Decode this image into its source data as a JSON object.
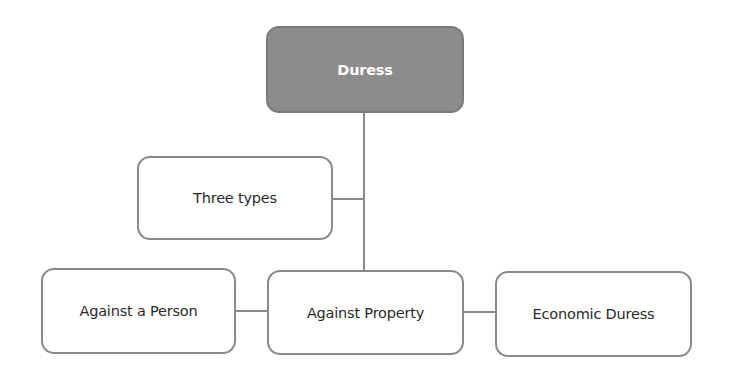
{
  "diagram": {
    "title": "Duress",
    "nodes": {
      "root": {
        "label": "Duress"
      },
      "types": {
        "label": "Three types"
      },
      "person": {
        "label": "Against a Person"
      },
      "property": {
        "label": "Against Property"
      },
      "economic": {
        "label": "Economic Duress"
      }
    },
    "edges": [
      {
        "from": "root",
        "to": "property"
      },
      {
        "from": "types",
        "to": "root-trunk"
      },
      {
        "from": "person",
        "to": "property"
      },
      {
        "from": "property",
        "to": "economic"
      }
    ],
    "colors": {
      "root_fill": "#8c8c8c",
      "root_text": "#ffffff",
      "node_border": "#8a8a8a",
      "node_fill": "#ffffff",
      "node_text": "#2a2a2a",
      "line": "#8a8a8a"
    }
  }
}
